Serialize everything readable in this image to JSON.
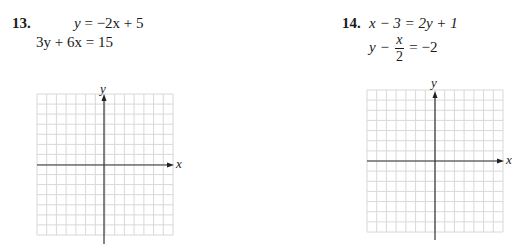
{
  "problems": [
    {
      "number": "13.",
      "equations": [
        "y = −2x + 5",
        "3y + 6x = 15"
      ],
      "eq1": {
        "lhs": "y",
        "rhs": "= −2x + 5"
      },
      "eq2": {
        "text": "3y + 6x = 15"
      },
      "graph": {
        "x_label": "x",
        "y_label": "y",
        "grid_cells": 14
      }
    },
    {
      "number": "14.",
      "equations": [
        "x − 3 = 2y + 1",
        "y − x/2 = −2"
      ],
      "eq1": {
        "text": "x − 3 = 2y + 1"
      },
      "eq2": {
        "lhs": "y −",
        "frac_num": "x",
        "frac_den": "2",
        "rhs": "= −2"
      },
      "graph": {
        "x_label": "x",
        "y_label": "y",
        "grid_cells": 14
      }
    }
  ],
  "colors": {
    "grid": "#d6d6d6",
    "axis": "#333333",
    "text": "#1a1a1a"
  }
}
